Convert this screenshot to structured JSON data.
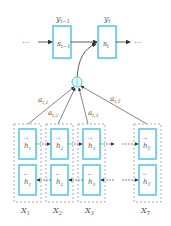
{
  "diagram": {
    "type": "attention-encoder-decoder",
    "colors": {
      "box": "#4fc3e8",
      "dashed": "#888888",
      "arrow": "#333333",
      "text": "#555555"
    },
    "decoder": {
      "left_ellipsis": "···",
      "right_ellipsis": "···",
      "states": [
        {
          "label": "s",
          "sub": "t−1",
          "output": "y",
          "output_sub": "t−1"
        },
        {
          "label": "s",
          "sub": "t",
          "output": "y",
          "output_sub": "t"
        }
      ]
    },
    "context_node": {
      "symbol": "+"
    },
    "attention_weights": [
      {
        "label": "a",
        "sub": "t,1"
      },
      {
        "label": "a",
        "sub": "t,2"
      },
      {
        "label": "a",
        "sub": "t,3"
      },
      {
        "label": "a",
        "sub": "t,T"
      }
    ],
    "encoder": {
      "columns": [
        {
          "forward": "h",
          "fsub": "1",
          "backward": "h",
          "bsub": "1",
          "input": "X",
          "isub": "1"
        },
        {
          "forward": "h",
          "fsub": "2",
          "backward": "h",
          "bsub": "2",
          "input": "X",
          "isub": "2"
        },
        {
          "forward": "h",
          "fsub": "3",
          "backward": "h",
          "bsub": "3",
          "input": "X",
          "isub": "3"
        },
        {
          "forward": "h",
          "fsub": "T",
          "backward": "h",
          "bsub": "T",
          "input": "X",
          "isub": "T"
        }
      ]
    }
  }
}
